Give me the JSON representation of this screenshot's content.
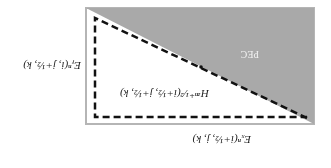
{
  "diagram": {
    "pec_label": "PEC",
    "labels": {
      "ey": "Eᵧⁿ(i, j+½, k)",
      "hz": "Hᶻⁿ⁺¹⁄²(i+½, j+½, k)",
      "ex": "Eₓⁿ(i+½, j, k)"
    },
    "colors": {
      "pec_fill": "#a9a9a9",
      "border": "#b5b5b5",
      "dash": "#111111"
    }
  }
}
